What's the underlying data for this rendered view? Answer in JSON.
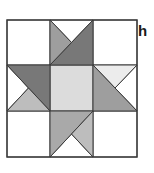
{
  "figure": {
    "label": "h",
    "grid": {
      "rows": 3,
      "cols": 3
    },
    "colors": {
      "white": "#ffffff",
      "center": "#dcdcdc",
      "dark": "#787878",
      "medium": "#9e9e9e",
      "medium_light": "#a9a9a9",
      "light": "#bdbdbd",
      "very_light": "#ececec",
      "outline": "#3a3a3a"
    },
    "cells": [
      {
        "position": "top-left",
        "fill": "white"
      },
      {
        "position": "top-middle",
        "pieces": [
          "medium left triangle",
          "white top triangle",
          "dark lower-right half"
        ]
      },
      {
        "position": "top-right",
        "fill": "white"
      },
      {
        "position": "middle-left",
        "pieces": [
          "dark upper-right half",
          "white left triangle",
          "light bottom triangle"
        ]
      },
      {
        "position": "center",
        "fill": "center"
      },
      {
        "position": "middle-right",
        "pieces": [
          "very light top triangle",
          "medium lower-left half",
          "white right triangle"
        ]
      },
      {
        "position": "bottom-left",
        "fill": "white"
      },
      {
        "position": "bottom-middle",
        "pieces": [
          "medium-light upper-left half",
          "light right triangle",
          "white bottom triangle"
        ]
      },
      {
        "position": "bottom-right",
        "fill": "white"
      }
    ]
  }
}
